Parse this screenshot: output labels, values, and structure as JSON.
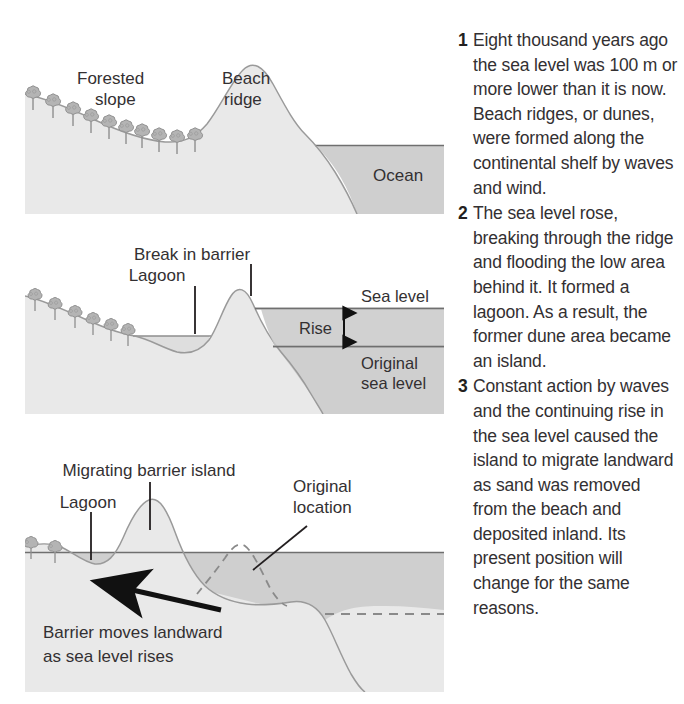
{
  "figure": {
    "colors": {
      "land": "#e9e9e9",
      "land_edge": "#9a9a9a",
      "ocean": "#cfcfcf",
      "ocean_line": "#6f6f6f",
      "tree": "#b0b0b0",
      "tree_edge": "#8a8a8a",
      "text": "#333032",
      "arrow": "#111111",
      "dashed": "#8a8a8a",
      "panel_bg": "#ffffff"
    }
  },
  "panels": [
    {
      "id": "panel-1",
      "name": "Stage 1 - original beach ridge along continental shelf",
      "labels": [
        {
          "id": "forested-slope",
          "line1": "Forested",
          "line2": "slope"
        },
        {
          "id": "beach-ridge",
          "line1": "Beach",
          "line2": "ridge"
        },
        {
          "id": "ocean",
          "line1": "Ocean",
          "line2": ""
        }
      ],
      "tree_count": 10
    },
    {
      "id": "panel-2",
      "name": "Stage 2 - sea level rise breaches the ridge and forms a lagoon",
      "labels": [
        {
          "id": "break-in-barrier",
          "line1": "Break in barrier",
          "line2": ""
        },
        {
          "id": "lagoon",
          "line1": "Lagoon",
          "line2": ""
        },
        {
          "id": "sea-level",
          "line1": "Sea level",
          "line2": ""
        },
        {
          "id": "rise",
          "line1": "Rise",
          "line2": ""
        },
        {
          "id": "original-sea-level",
          "line1": "Original",
          "line2": "sea level"
        }
      ],
      "tree_count": 6
    },
    {
      "id": "panel-3",
      "name": "Stage 3 - barrier island migrates landward",
      "labels": [
        {
          "id": "migrating-barrier-island",
          "line1": "Migrating barrier island",
          "line2": ""
        },
        {
          "id": "lagoon",
          "line1": "Lagoon",
          "line2": ""
        },
        {
          "id": "original-location",
          "line1": "Original",
          "line2": "location"
        },
        {
          "id": "barrier-moves",
          "line1": "Barrier moves landward",
          "line2": "as sea level rises"
        }
      ],
      "tree_count": 2
    }
  ],
  "steps": [
    {
      "number": "1",
      "text": "Eight thousand years ago the sea level was 100 m or more lower than it is now. Beach ridges, or dunes, were formed along the continental shelf by waves and wind."
    },
    {
      "number": "2",
      "text": "The sea level rose, breaking through the ridge and flooding the low area behind it. It formed a lagoon. As a result, the former dune area became an island."
    },
    {
      "number": "3",
      "text": "Constant action by waves and the continuing rise in the sea level caused the island to migrate landward as sand was removed from the beach and deposited inland. Its present position will change for the same reasons."
    }
  ]
}
